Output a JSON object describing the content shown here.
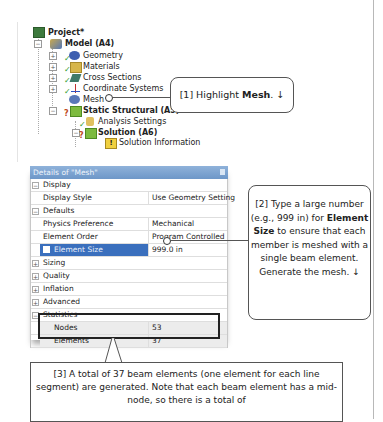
{
  "tree": {
    "nodes": [
      {
        "label": "Project*",
        "icon": "project-icon",
        "bold": true
      },
      {
        "label": "Model (A4)",
        "icon": "model-icon",
        "bold": true
      },
      {
        "label": "Geometry",
        "icon": "geometry-icon"
      },
      {
        "label": "Materials",
        "icon": "materials-icon"
      },
      {
        "label": "Cross Sections",
        "icon": "cross-sections-icon"
      },
      {
        "label": "Coordinate Systems",
        "icon": "coordinate-systems-icon"
      },
      {
        "label": "Mesh",
        "icon": "mesh-icon"
      },
      {
        "label": "Static Structural (A5)",
        "icon": "static-structural-icon",
        "bold": true
      },
      {
        "label": "Analysis Settings",
        "icon": "analysis-settings-icon"
      },
      {
        "label": "Solution (A6)",
        "icon": "solution-icon",
        "bold": true
      },
      {
        "label": "Solution Information",
        "icon": "solution-information-icon"
      }
    ]
  },
  "details": {
    "title": "Details of \"Mesh\"",
    "rows": [
      {
        "type": "category",
        "label": "Display",
        "state": "-"
      },
      {
        "type": "prop",
        "key": "Display Style",
        "value": "Use Geometry Setting"
      },
      {
        "type": "category",
        "label": "Defaults",
        "state": "-"
      },
      {
        "type": "prop",
        "key": "Physics Preference",
        "value": "Mechanical"
      },
      {
        "type": "prop",
        "key": "Element Order",
        "value": "Program Controlled"
      },
      {
        "type": "prop",
        "key": "Element Size",
        "value": "999.0 in",
        "selected": true
      },
      {
        "type": "category",
        "label": "Sizing",
        "state": "+"
      },
      {
        "type": "category",
        "label": "Quality",
        "state": "+"
      },
      {
        "type": "category",
        "label": "Inflation",
        "state": "+"
      },
      {
        "type": "category",
        "label": "Advanced",
        "state": "+"
      },
      {
        "type": "category",
        "label": "Statistics",
        "state": "-"
      },
      {
        "type": "stat",
        "key": "Nodes",
        "value": "53"
      },
      {
        "type": "stat",
        "key": "Elements",
        "value": "37"
      }
    ]
  },
  "callouts": {
    "c1": {
      "pre": "[1] Highlight ",
      "bold": "Mesh",
      "post": ".  ↓"
    },
    "c2": {
      "pre": "[2] Type a large number (e.g., 999 in) for ",
      "bold": "Element Size",
      "post": " to ensure that each member is meshed with a single beam element. Generate the mesh. ↓"
    },
    "c3": {
      "text": "[3] A total of 37 beam elements (one element for each line segment) are generated.  Note that each beam element has a mid-node, so there is a total of"
    }
  },
  "colors": {
    "selection": "#3a6fbd",
    "title_bar": "#7aa1cf",
    "check": "#2e9a2e"
  }
}
